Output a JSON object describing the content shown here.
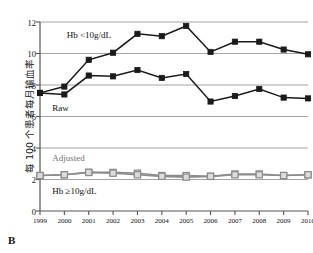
{
  "panel": {
    "letter": "B"
  },
  "chart_data": {
    "type": "line",
    "title": "",
    "xlabel": "",
    "ylabel": "每 100 个患者每月输血率",
    "x": [
      1999,
      2000,
      2001,
      2002,
      2003,
      2004,
      2005,
      2006,
      2007,
      2008,
      2009,
      2010
    ],
    "xticklabels": [
      "1999",
      "2000",
      "2001",
      "2002",
      "2003",
      "2004",
      "2005",
      "2006",
      "2007",
      "2008",
      "2009",
      "2010"
    ],
    "ylim": [
      0,
      12
    ],
    "yticks": [
      0,
      2,
      4,
      6,
      8,
      10,
      12
    ],
    "yticklabels": [
      "0",
      "2",
      "4",
      "6",
      "8",
      "10",
      "12"
    ],
    "grid": "horizontal",
    "legend": "none",
    "series": [
      {
        "name": "Raw, Hb <10g/dL",
        "color": "#1a1a1a",
        "marker": "filled-square",
        "values": [
          7.5,
          7.9,
          9.6,
          10.05,
          11.25,
          11.1,
          11.75,
          10.1,
          10.75,
          10.75,
          10.25,
          9.95
        ]
      },
      {
        "name": "Raw, Hb ≥10g/dL",
        "color": "#1a1a1a",
        "marker": "filled-square",
        "values": [
          7.5,
          7.4,
          8.6,
          8.55,
          8.95,
          8.45,
          8.7,
          6.95,
          7.3,
          7.75,
          7.2,
          7.15
        ]
      },
      {
        "name": "Adjusted, Hb <10g/dL",
        "color": "#8c8c8c",
        "marker": "open-square",
        "values": [
          2.25,
          2.3,
          2.45,
          2.45,
          2.4,
          2.25,
          2.25,
          2.2,
          2.35,
          2.35,
          2.25,
          2.3
        ]
      },
      {
        "name": "Adjusted, Hb ≥10g/dL",
        "color": "#8c8c8c",
        "marker": "open-square",
        "values": [
          2.25,
          2.3,
          2.45,
          2.4,
          2.3,
          2.2,
          2.15,
          2.2,
          2.3,
          2.3,
          2.25,
          2.3
        ]
      }
    ],
    "annotations": [
      {
        "id": "hb-low-label",
        "text": "Hb <10g/dL",
        "x": 2000.1,
        "y": 11.1,
        "color": "#111111"
      },
      {
        "id": "raw-label",
        "text": "Raw",
        "x": 1999.5,
        "y": 6.45,
        "color": "#111111"
      },
      {
        "id": "adjusted-label",
        "text": "Adjusted",
        "x": 1999.5,
        "y": 3.3,
        "color": "#6f6f6f"
      },
      {
        "id": "hb-high-label",
        "text": "Hb ≥10g/dL",
        "x": 1999.5,
        "y": 1.2,
        "color": "#111111"
      }
    ]
  }
}
